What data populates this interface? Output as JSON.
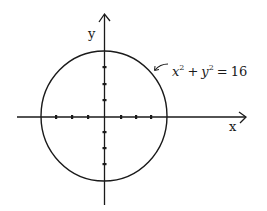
{
  "diagram": {
    "type": "circle-on-coordinate-axes",
    "equation_label": {
      "x_var": "x",
      "y_var": "y",
      "exponent": "2",
      "plus": "+",
      "equals": "=",
      "rhs": "16",
      "full_text": "x² + y² = 16"
    },
    "axes": {
      "x_label": "x",
      "y_label": "y",
      "ticks_per_half_axis": 3
    },
    "circle": {
      "center": [
        0,
        0
      ],
      "radius": 4
    },
    "colors": {
      "stroke": "#1a1a1a",
      "background": "#ffffff"
    }
  }
}
